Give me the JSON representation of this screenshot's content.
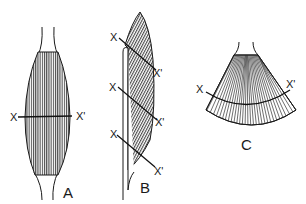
{
  "figure": {
    "colors": {
      "ink": "#1a1a1a",
      "fiber": "#4a4a4a",
      "background": "#ffffff"
    },
    "panels": [
      {
        "id": "A",
        "label": "A",
        "type": "fusiform-parallel",
        "section_start": "X",
        "section_end": "X'"
      },
      {
        "id": "B",
        "label": "B",
        "type": "unipennate",
        "sections": [
          {
            "start": "X",
            "end": "X'"
          },
          {
            "start": "X",
            "end": "X'"
          },
          {
            "start": "X",
            "end": "X'"
          }
        ]
      },
      {
        "id": "C",
        "label": "C",
        "type": "convergent-fan",
        "section_start": "X",
        "section_end": "X'"
      }
    ]
  }
}
